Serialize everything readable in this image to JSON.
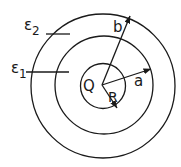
{
  "diagram": {
    "type": "concentric-spheres",
    "center": {
      "x": 103,
      "y": 85
    },
    "colors": {
      "line": "#1a1a1a",
      "background": "#ffffff"
    },
    "circles": [
      {
        "id": "inner",
        "r": 22
      },
      {
        "id": "middle",
        "r": 49
      },
      {
        "id": "outer",
        "r": 73
      }
    ],
    "labels": {
      "charge": "Q",
      "radius_inner": "R",
      "radius_middle": "a",
      "radius_outer": "b",
      "eps1_main": "ε",
      "eps1_sub": "1",
      "eps2_main": "ε",
      "eps2_sub": "2"
    },
    "regions": [
      {
        "name": "inner-dielectric",
        "label": "ε1",
        "between": [
          "R",
          "a"
        ]
      },
      {
        "name": "outer-dielectric",
        "label": "ε2",
        "between": [
          "a",
          "b"
        ]
      }
    ],
    "arrows": [
      {
        "name": "radius-b",
        "label": "b",
        "to": {
          "x": 130,
          "y": 16
        }
      },
      {
        "name": "radius-a",
        "label": "a",
        "to": {
          "x": 151,
          "y": 69
        }
      },
      {
        "name": "radius-R",
        "label": "R",
        "to": {
          "x": 117,
          "y": 108
        }
      }
    ]
  }
}
